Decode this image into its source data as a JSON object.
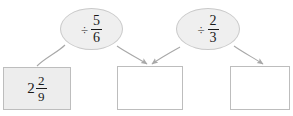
{
  "diagram": {
    "type": "flow-chart",
    "background_color": "#ffffff",
    "box_fill_shaded": "#ededed",
    "box_fill_empty": "#ffffff",
    "box_stroke": "#bdbdbd",
    "bubble_fill": "#efefef",
    "bubble_stroke": "#c9c9c9",
    "arrow_color": "#a8a8a8",
    "boxes": [
      {
        "id": "start-box",
        "state": "filled",
        "whole": "2",
        "numerator": "2",
        "denominator": "9",
        "value_text": "2 2/9"
      },
      {
        "id": "result-box-1",
        "state": "empty",
        "whole": "",
        "numerator": "",
        "denominator": "",
        "value_text": ""
      },
      {
        "id": "result-box-2",
        "state": "empty",
        "whole": "",
        "numerator": "",
        "denominator": "",
        "value_text": ""
      }
    ],
    "operations": [
      {
        "id": "operation-1",
        "sign": "÷",
        "numerator": "5",
        "denominator": "6",
        "label_text": "÷ 5/6"
      },
      {
        "id": "operation-2",
        "sign": "÷",
        "numerator": "2",
        "denominator": "3",
        "label_text": "÷ 2/3"
      }
    ]
  }
}
